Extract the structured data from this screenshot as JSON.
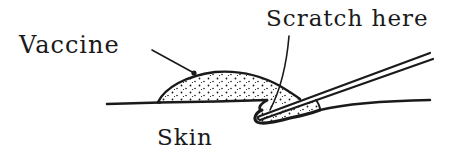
{
  "diagram": {
    "labels": {
      "vaccine": "Vaccine",
      "scratch": "Scratch here",
      "skin": "Skin"
    },
    "colors": {
      "ink": "#1a1a1a",
      "background": "#ffffff"
    }
  }
}
